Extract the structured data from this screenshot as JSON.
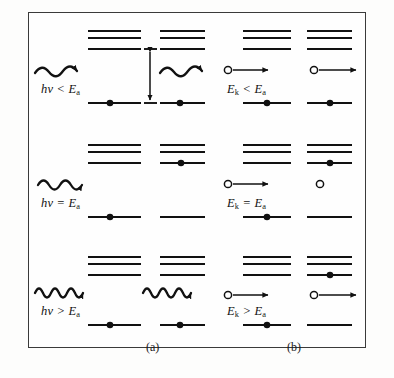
{
  "figure": {
    "frame": {
      "border_color": "#3a3a3a",
      "background": "#fefefe"
    },
    "ink_color": "#111111"
  },
  "panels": [
    {
      "key": "a",
      "label": "(a)",
      "mechanism": "photon-absorption"
    },
    {
      "key": "b",
      "label": "(b)",
      "mechanism": "electron-impact"
    }
  ],
  "rows": [
    {
      "key": "row-less",
      "condition": "less-than",
      "panel_a": {
        "label_html": "hν &lt; E<sub>a</sub>",
        "label_plain": "hν < E_a",
        "quantity": "hν",
        "relation": "<",
        "threshold": "E_a",
        "projectile": "photon",
        "wave_humps": 2,
        "wave_frequency": "low",
        "before": {
          "electron_level": 1,
          "projectile_present": true
        },
        "after": {
          "electron_level": 1,
          "projectile_present": true,
          "projectile_transmitted": true
        },
        "gap_arrow": {
          "shown": true,
          "from_level": 1,
          "to_level": 3,
          "meaning": "E_a excitation gap"
        }
      },
      "panel_b": {
        "label_html": "E<sub>k</sub> &lt; E<sub>a</sub>",
        "label_plain": "E_k < E_a",
        "quantity": "E_k",
        "relation": "<",
        "threshold": "E_a",
        "projectile": "electron",
        "before": {
          "electron_level": 1,
          "projectile_present": true,
          "projectile_moving": true
        },
        "after": {
          "electron_level": 1,
          "projectile_present": true,
          "projectile_moving": true
        }
      }
    },
    {
      "key": "row-equal",
      "condition": "equal-to",
      "panel_a": {
        "label_html": "hν = E<sub>a</sub>",
        "label_plain": "hν = E_a",
        "quantity": "hν",
        "relation": "=",
        "threshold": "E_a",
        "projectile": "photon",
        "wave_humps": 3,
        "wave_frequency": "medium",
        "before": {
          "electron_level": 1,
          "projectile_present": true
        },
        "after": {
          "electron_level": 3,
          "projectile_present": false,
          "projectile_absorbed": true
        },
        "gap_arrow": {
          "shown": false
        }
      },
      "panel_b": {
        "label_html": "E<sub>k</sub> = E<sub>a</sub>",
        "label_plain": "E_k = E_a",
        "quantity": "E_k",
        "relation": "=",
        "threshold": "E_a",
        "projectile": "electron",
        "before": {
          "electron_level": 1,
          "projectile_present": true,
          "projectile_moving": true
        },
        "after": {
          "electron_level": 3,
          "projectile_present": true,
          "projectile_moving": false
        }
      }
    },
    {
      "key": "row-greater",
      "condition": "greater-than",
      "panel_a": {
        "label_html": "hν &gt; E<sub>a</sub>",
        "label_plain": "hν > E_a",
        "quantity": "hν",
        "relation": ">",
        "threshold": "E_a",
        "projectile": "photon",
        "wave_humps": 4,
        "wave_frequency": "high",
        "before": {
          "electron_level": 1,
          "projectile_present": true
        },
        "after": {
          "electron_level": 1,
          "projectile_present": true,
          "projectile_transmitted": true
        },
        "gap_arrow": {
          "shown": false
        }
      },
      "panel_b": {
        "label_html": "E<sub>k</sub> &gt; E<sub>a</sub>",
        "label_plain": "E_k > E_a",
        "quantity": "E_k",
        "relation": ">",
        "threshold": "E_a",
        "projectile": "electron",
        "before": {
          "electron_level": 1,
          "projectile_present": true,
          "projectile_moving": true
        },
        "after": {
          "electron_level": 3,
          "projectile_present": true,
          "projectile_moving": true
        }
      }
    }
  ],
  "level_scheme": {
    "count": 4,
    "names": [
      "ground",
      "excited-3",
      "excited-2",
      "excited-1"
    ],
    "description": "one ground level plus three closely spaced upper levels"
  }
}
